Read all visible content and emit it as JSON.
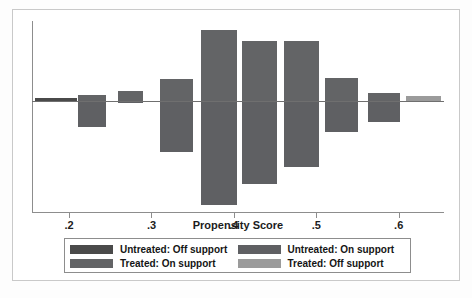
{
  "chart": {
    "type": "bar",
    "title": "",
    "xlabel": "Propensity Score",
    "ylabel": ""
  },
  "axis": {
    "ticks": [
      {
        "value": 0.2,
        "label": ".2"
      },
      {
        "value": 0.3,
        "label": ".3"
      },
      {
        "value": 0.4,
        "label": ".4"
      },
      {
        "value": 0.5,
        "label": ".5"
      },
      {
        "value": 0.6,
        "label": ".6"
      }
    ]
  },
  "legend": {
    "entries": [
      {
        "label": "Untreated: Off support",
        "color": "#4a4a4a",
        "key": "untreated-off-support"
      },
      {
        "label": "Untreated: On support",
        "color": "#5f6063",
        "key": "untreated-on-support"
      },
      {
        "label": "Treated: On support",
        "color": "#636466",
        "key": "treated-on-support"
      },
      {
        "label": "Treated: Off support",
        "color": "#9b9b9b",
        "key": "treated-off-support"
      }
    ]
  },
  "chart_data": {
    "type": "bar",
    "title": "",
    "xlabel": "Propensity Score",
    "ylabel": "",
    "xlim": [
      0.155,
      0.655
    ],
    "grid": false,
    "legend_position": "bottom",
    "baseline": 0,
    "xtick_labels": [
      ".2",
      ".3",
      ".4",
      ".5",
      ".6"
    ],
    "xticks": [
      0.2,
      0.3,
      0.4,
      0.5,
      0.6
    ],
    "bins": [
      {
        "x_center": 0.183,
        "x_low": 0.168,
        "x_high": 0.198,
        "treated_up": 0.02,
        "untreated_down": 0.0,
        "treated_group": "Treated: Off support",
        "untreated_group": "Untreated: On support"
      },
      {
        "x_center": 0.222,
        "x_low": 0.207,
        "x_high": 0.237,
        "treated_up": 0.12,
        "untreated_down": 1.28,
        "treated_group": "Treated: On support",
        "untreated_group": "Untreated: On support"
      },
      {
        "x_center": 0.27,
        "x_low": 0.255,
        "x_high": 0.285,
        "treated_up": 0.42,
        "untreated_down": 0.02,
        "treated_group": "Treated: On support",
        "untreated_group": "Untreated: On support"
      },
      {
        "x_center": 0.318,
        "x_low": 0.3,
        "x_high": 0.336,
        "treated_up": 2.28,
        "untreated_down": 3.22,
        "treated_group": "Treated: On support",
        "untreated_group": "Untreated: On support"
      },
      {
        "x_center": 0.368,
        "x_low": 0.348,
        "x_high": 0.389,
        "treated_up": 5.45,
        "untreated_down": 7.72,
        "treated_group": "Treated: On support",
        "untreated_group": "Untreated: On support"
      },
      {
        "x_center": 0.418,
        "x_low": 0.398,
        "x_high": 0.437,
        "treated_up": 4.4,
        "untreated_down": 6.35,
        "treated_group": "Treated: On support",
        "untreated_group": "Untreated: On support"
      },
      {
        "x_center": 0.468,
        "x_low": 0.448,
        "x_high": 0.489,
        "treated_up": 4.4,
        "untreated_down": 5.12,
        "treated_group": "Treated: On support",
        "untreated_group": "Untreated: On support"
      },
      {
        "x_center": 0.516,
        "x_low": 0.498,
        "x_high": 0.535,
        "treated_up": 2.3,
        "untreated_down": 2.1,
        "treated_group": "Treated: On support",
        "untreated_group": "Untreated: On support"
      },
      {
        "x_center": 0.566,
        "x_low": 0.549,
        "x_high": 0.584,
        "treated_up": 1.22,
        "untreated_down": 0.9,
        "treated_group": "Treated: On support",
        "untreated_group": "Untreated: On support"
      },
      {
        "x_center": 0.615,
        "x_low": 0.597,
        "x_high": 0.634,
        "treated_up": 0.18,
        "untreated_down": 0.0,
        "treated_group": "Treated: Off support",
        "untreated_group": "Untreated: On support"
      }
    ]
  },
  "bars": [
    {
      "name": "bin-1-treated-off",
      "left": 3,
      "top": 77,
      "width": 42,
      "height": 3,
      "color": "#4a4a4a"
    },
    {
      "name": "bin-2-treated-on",
      "left": 46,
      "top": 74,
      "width": 28,
      "height": 6,
      "color": "#636466"
    },
    {
      "name": "bin-2-untreated-on",
      "left": 46,
      "top": 81,
      "width": 28,
      "height": 25,
      "color": "#5f6063"
    },
    {
      "name": "bin-3-treated-on",
      "left": 86,
      "top": 70,
      "width": 25,
      "height": 10,
      "color": "#636466"
    },
    {
      "name": "bin-3-untreated-on",
      "left": 86,
      "top": 81,
      "width": 25,
      "height": 1,
      "color": "#5f6063"
    },
    {
      "name": "bin-4-treated-on",
      "left": 128,
      "top": 58,
      "width": 33,
      "height": 22,
      "color": "#636466"
    },
    {
      "name": "bin-4-untreated-on",
      "left": 128,
      "top": 81,
      "width": 33,
      "height": 50,
      "color": "#5f6063"
    },
    {
      "name": "bin-5-treated-on",
      "left": 169,
      "top": 9,
      "width": 36,
      "height": 71,
      "color": "#636466"
    },
    {
      "name": "bin-5-untreated-on",
      "left": 169,
      "top": 81,
      "width": 36,
      "height": 103,
      "color": "#5f6063"
    },
    {
      "name": "bin-6-treated-on",
      "left": 210,
      "top": 20,
      "width": 35,
      "height": 60,
      "color": "#636466"
    },
    {
      "name": "bin-6-untreated-on",
      "left": 210,
      "top": 81,
      "width": 35,
      "height": 82,
      "color": "#5f6063"
    },
    {
      "name": "bin-7-treated-on",
      "left": 252,
      "top": 20,
      "width": 35,
      "height": 60,
      "color": "#636466"
    },
    {
      "name": "bin-7-untreated-on",
      "left": 252,
      "top": 81,
      "width": 35,
      "height": 65,
      "color": "#5f6063"
    },
    {
      "name": "bin-8-treated-on",
      "left": 293,
      "top": 57,
      "width": 33,
      "height": 23,
      "color": "#636466"
    },
    {
      "name": "bin-8-untreated-on",
      "left": 293,
      "top": 81,
      "width": 33,
      "height": 30,
      "color": "#5f6063"
    },
    {
      "name": "bin-9-treated-on",
      "left": 336,
      "top": 72,
      "width": 32,
      "height": 8,
      "color": "#636466"
    },
    {
      "name": "bin-9-untreated-on",
      "left": 336,
      "top": 81,
      "width": 32,
      "height": 20,
      "color": "#5f6063"
    },
    {
      "name": "bin-10-treated-off",
      "left": 374,
      "top": 75,
      "width": 35,
      "height": 5,
      "color": "#9b9b9b"
    }
  ]
}
